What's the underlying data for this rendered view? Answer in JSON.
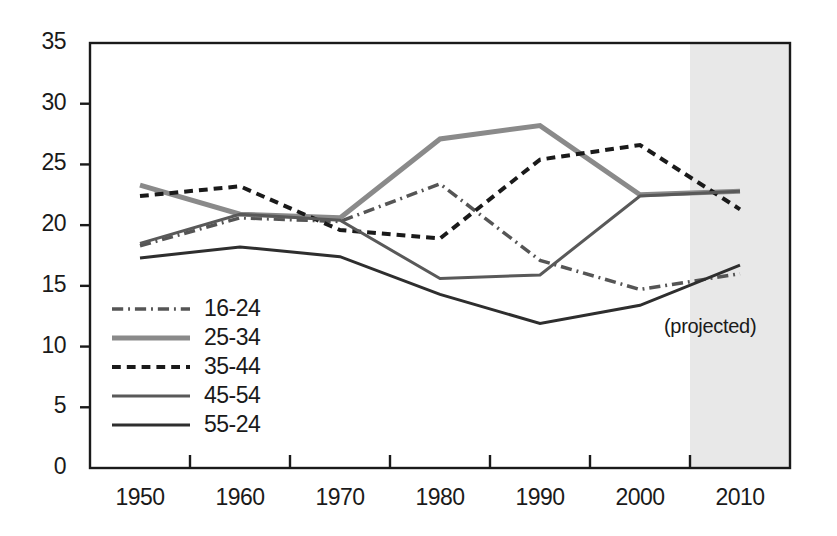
{
  "chart_data": {
    "type": "line",
    "title": "",
    "xlabel": "",
    "ylabel": "",
    "x": [
      1950,
      1960,
      1970,
      1980,
      1990,
      2000,
      2010
    ],
    "xlim": [
      1945,
      2015
    ],
    "ylim": [
      0,
      35
    ],
    "yticks": [
      0,
      5,
      10,
      15,
      20,
      25,
      30,
      35
    ],
    "xticks": [
      1950,
      1960,
      1970,
      1980,
      1990,
      2000,
      2010
    ],
    "xtick_labels": [
      "1950",
      "1960",
      "1970",
      "1980",
      "1990",
      "2000",
      "2010"
    ],
    "ytick_labels": [
      "0",
      "5",
      "10",
      "15",
      "20",
      "25",
      "30",
      "35"
    ],
    "grid": false,
    "legend_position": "lower-left",
    "minor_tick_positions": [
      1955,
      1965,
      1975,
      1985,
      1995,
      2005
    ],
    "annotations": [
      {
        "text": "(projected)",
        "x": 2008,
        "y": 11.5
      }
    ],
    "shaded_region": {
      "label": "(projected)",
      "x_start": 2005,
      "x_end": 2015,
      "color": "#e8e8e8"
    },
    "series": [
      {
        "name": "16-24",
        "style": "dashdot",
        "color": "#555555",
        "width": 3.5,
        "values": [
          18.3,
          20.6,
          20.3,
          23.4,
          17.1,
          14.7,
          16.0
        ]
      },
      {
        "name": "25-34",
        "style": "solid",
        "color": "#8a8a8a",
        "width": 5,
        "values": [
          23.3,
          20.9,
          20.6,
          27.1,
          28.2,
          22.5,
          22.8
        ]
      },
      {
        "name": "35-44",
        "style": "dashed",
        "color": "#1a1a1a",
        "width": 4,
        "values": [
          22.4,
          23.2,
          19.6,
          18.9,
          25.4,
          26.6,
          21.3
        ]
      },
      {
        "name": "45-54",
        "style": "solid",
        "color": "#595959",
        "width": 3,
        "values": [
          18.5,
          20.9,
          20.4,
          15.6,
          15.9,
          22.4,
          22.8
        ]
      },
      {
        "name": "55-24",
        "style": "solid",
        "color": "#2e2e2e",
        "width": 3,
        "values": [
          17.3,
          18.2,
          17.4,
          14.3,
          11.9,
          13.4,
          16.7
        ]
      }
    ]
  },
  "legend": {
    "items": [
      {
        "label": "16-24"
      },
      {
        "label": "25-34"
      },
      {
        "label": "35-44"
      },
      {
        "label": "45-54"
      },
      {
        "label": "55-24"
      }
    ]
  },
  "projected": {
    "label": "(projected)"
  }
}
